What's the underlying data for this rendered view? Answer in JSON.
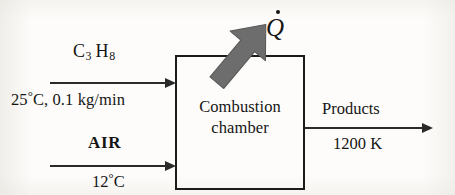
{
  "figure": {
    "type": "process-flow-diagram",
    "background_color": "#fdfcfa",
    "line_color": "#2a2a2a",
    "heat_arrow_color": "#6d6d6d"
  },
  "chamber": {
    "label_line1": "Combustion",
    "label_line2": "chamber",
    "border_color": "#1b1b1b"
  },
  "fuel_stream": {
    "name": "fuel-inlet",
    "formula_prefix": "C",
    "formula_sub1": "3",
    "formula_mid": "H",
    "formula_sub2": "8",
    "formula_plain": "C3H8",
    "temperature": "25",
    "temperature_unit": "°C",
    "state_text": "25°C, 0.1 kg/min",
    "state_prefix": "25",
    "state_suffix": "C, 0.1 kg/min",
    "mass_flow_rate": "0.1 kg/min"
  },
  "air_stream": {
    "name": "air-inlet",
    "label": "AIR",
    "temperature": "12",
    "temperature_unit": "°C",
    "state_prefix": "12",
    "state_suffix": "C",
    "state_text": "12°C"
  },
  "products_stream": {
    "name": "products-outlet",
    "label": "Products",
    "temperature": "1200 K"
  },
  "heat_transfer": {
    "symbol": "Q",
    "symbol_with_dot": "Q̇",
    "meaning": "rate of heat loss",
    "direction": "out of chamber, up and to the right"
  }
}
